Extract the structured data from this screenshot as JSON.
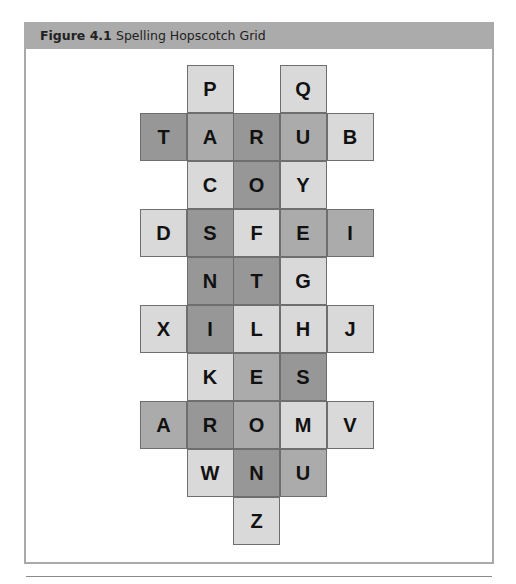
{
  "figure": {
    "label": "Figure 4.1",
    "title": "Spelling Hopscotch Grid"
  },
  "colors": {
    "header_bar": "#ababab",
    "frame_border": "#a9a9a9",
    "cell_light": "#d9d9d9",
    "cell_medium": "#ababab",
    "cell_dark": "#979797",
    "cell_border": "#6e6e6e",
    "letter": "#111111"
  },
  "grid": {
    "columns": 5,
    "rows": 10,
    "cells": [
      {
        "row": 0,
        "col": 1,
        "letter": "P",
        "shade": "light"
      },
      {
        "row": 0,
        "col": 3,
        "letter": "Q",
        "shade": "light"
      },
      {
        "row": 1,
        "col": 0,
        "letter": "T",
        "shade": "dark"
      },
      {
        "row": 1,
        "col": 1,
        "letter": "A",
        "shade": "medium"
      },
      {
        "row": 1,
        "col": 2,
        "letter": "R",
        "shade": "dark"
      },
      {
        "row": 1,
        "col": 3,
        "letter": "U",
        "shade": "medium"
      },
      {
        "row": 1,
        "col": 4,
        "letter": "B",
        "shade": "light"
      },
      {
        "row": 2,
        "col": 1,
        "letter": "C",
        "shade": "light"
      },
      {
        "row": 2,
        "col": 2,
        "letter": "O",
        "shade": "dark"
      },
      {
        "row": 2,
        "col": 3,
        "letter": "Y",
        "shade": "light"
      },
      {
        "row": 3,
        "col": 0,
        "letter": "D",
        "shade": "light"
      },
      {
        "row": 3,
        "col": 1,
        "letter": "S",
        "shade": "dark"
      },
      {
        "row": 3,
        "col": 2,
        "letter": "F",
        "shade": "light"
      },
      {
        "row": 3,
        "col": 3,
        "letter": "E",
        "shade": "medium"
      },
      {
        "row": 3,
        "col": 4,
        "letter": "I",
        "shade": "medium"
      },
      {
        "row": 4,
        "col": 1,
        "letter": "N",
        "shade": "dark"
      },
      {
        "row": 4,
        "col": 2,
        "letter": "T",
        "shade": "dark"
      },
      {
        "row": 4,
        "col": 3,
        "letter": "G",
        "shade": "light"
      },
      {
        "row": 5,
        "col": 0,
        "letter": "X",
        "shade": "light"
      },
      {
        "row": 5,
        "col": 1,
        "letter": "I",
        "shade": "dark"
      },
      {
        "row": 5,
        "col": 2,
        "letter": "L",
        "shade": "light"
      },
      {
        "row": 5,
        "col": 3,
        "letter": "H",
        "shade": "light"
      },
      {
        "row": 5,
        "col": 4,
        "letter": "J",
        "shade": "light"
      },
      {
        "row": 6,
        "col": 1,
        "letter": "K",
        "shade": "light"
      },
      {
        "row": 6,
        "col": 2,
        "letter": "E",
        "shade": "medium"
      },
      {
        "row": 6,
        "col": 3,
        "letter": "S",
        "shade": "dark"
      },
      {
        "row": 7,
        "col": 0,
        "letter": "A",
        "shade": "medium"
      },
      {
        "row": 7,
        "col": 1,
        "letter": "R",
        "shade": "dark"
      },
      {
        "row": 7,
        "col": 2,
        "letter": "O",
        "shade": "medium"
      },
      {
        "row": 7,
        "col": 3,
        "letter": "M",
        "shade": "light"
      },
      {
        "row": 7,
        "col": 4,
        "letter": "V",
        "shade": "light"
      },
      {
        "row": 8,
        "col": 1,
        "letter": "W",
        "shade": "light"
      },
      {
        "row": 8,
        "col": 2,
        "letter": "N",
        "shade": "dark"
      },
      {
        "row": 8,
        "col": 3,
        "letter": "U",
        "shade": "medium"
      },
      {
        "row": 9,
        "col": 2,
        "letter": "Z",
        "shade": "light"
      }
    ]
  }
}
